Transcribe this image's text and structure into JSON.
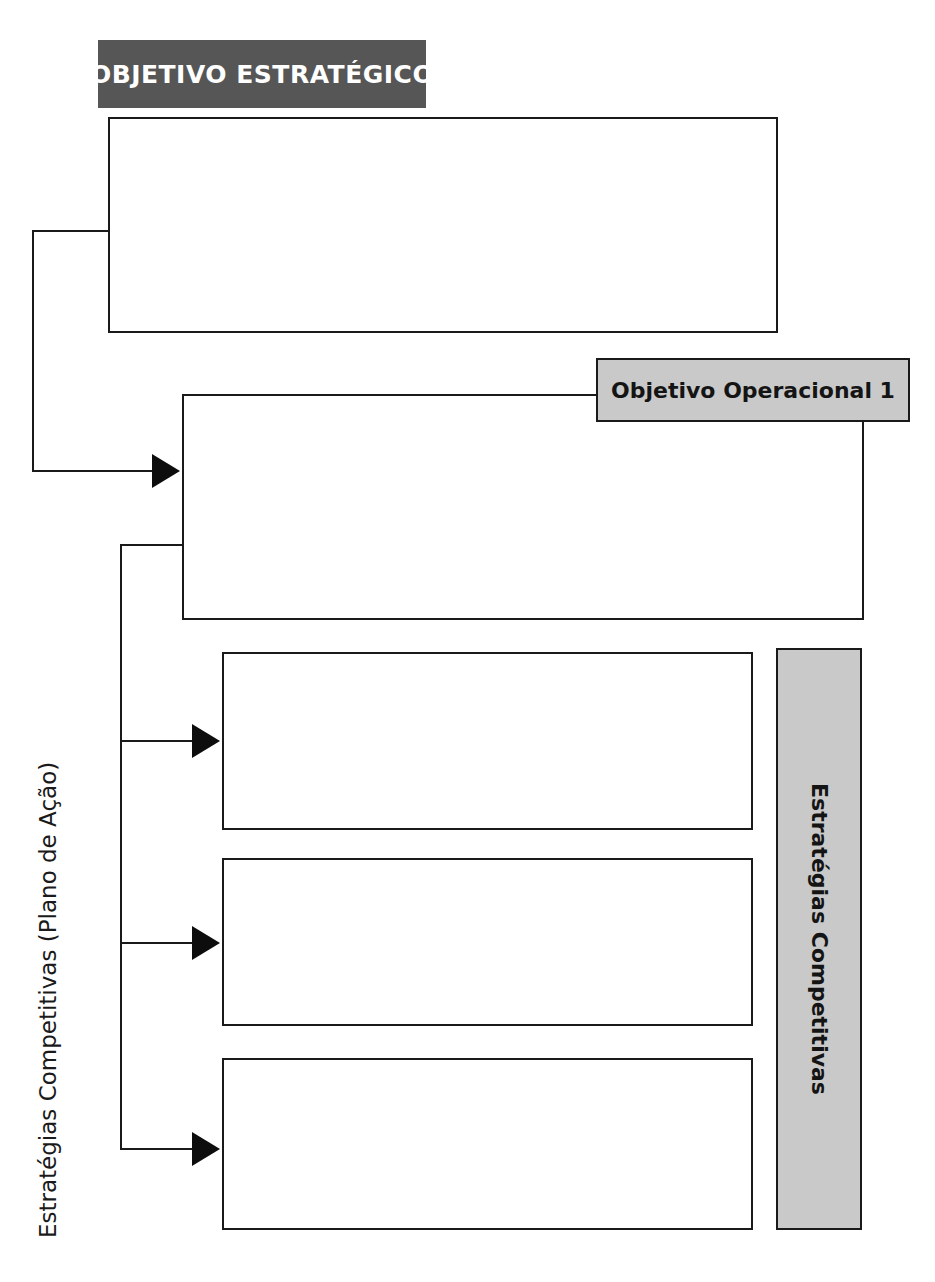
{
  "diagram": {
    "title_band": {
      "label": "OBJETIVO ESTRATÉGICO",
      "bg_color": "#565656",
      "text_color": "#ffffff"
    },
    "operational_tag": {
      "label": "Objetivo Operacional 1",
      "bg_color": "#c9c9c9",
      "text_color": "#141414"
    },
    "side_bar": {
      "label": "Estratégias Competitivas",
      "bg_color": "#c9c9c9",
      "text_color": "#141414"
    },
    "left_caption": {
      "label": "Estratégias Competitivas (Plano de Ação)",
      "text_color": "#1a1a1a"
    },
    "boxes": [
      {
        "name": "strategic-objective-box",
        "content": ""
      },
      {
        "name": "operational-objective-box",
        "content": ""
      },
      {
        "name": "strategy-box-1",
        "content": ""
      },
      {
        "name": "strategy-box-2",
        "content": ""
      },
      {
        "name": "strategy-box-3",
        "content": ""
      }
    ],
    "connectors": {
      "count": 4,
      "stroke_color": "#1a1a1a",
      "arrow_color": "#0d0d0d"
    }
  }
}
